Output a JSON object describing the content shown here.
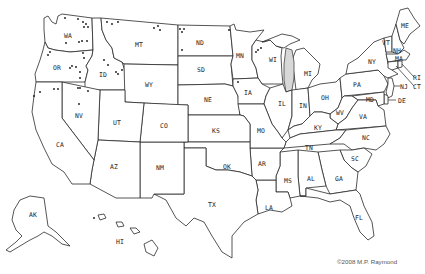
{
  "map": {
    "title": "United States outline map with state abbreviations",
    "line_color": "#2a2a2a",
    "background": "#ffffff",
    "lake_fill": "#d8d8d8",
    "states": [
      {
        "abbr": "WA",
        "x": 68,
        "y": 36
      },
      {
        "abbr": "OR",
        "x": 57,
        "y": 68
      },
      {
        "abbr": "ID",
        "x": 103,
        "y": 75
      },
      {
        "abbr": "MT",
        "x": 139,
        "y": 45
      },
      {
        "abbr": "WY",
        "x": 149,
        "y": 85
      },
      {
        "abbr": "ND",
        "x": 200,
        "y": 43
      },
      {
        "abbr": "SD",
        "x": 201,
        "y": 70
      },
      {
        "abbr": "NE",
        "x": 208,
        "y": 100
      },
      {
        "abbr": "MN",
        "x": 240,
        "y": 56
      },
      {
        "abbr": "WI",
        "x": 273,
        "y": 60
      },
      {
        "abbr": "MI",
        "x": 308,
        "y": 74
      },
      {
        "abbr": "IA",
        "x": 248,
        "y": 93
      },
      {
        "abbr": "IL",
        "x": 282,
        "y": 104
      },
      {
        "abbr": "IN",
        "x": 303,
        "y": 106
      },
      {
        "abbr": "OH",
        "x": 325,
        "y": 98
      },
      {
        "abbr": "PA",
        "x": 357,
        "y": 85
      },
      {
        "abbr": "NY",
        "x": 372,
        "y": 62
      },
      {
        "abbr": "VT",
        "x": 386,
        "y": 43
      },
      {
        "abbr": "NH",
        "x": 397,
        "y": 51
      },
      {
        "abbr": "ME",
        "x": 405,
        "y": 26
      },
      {
        "abbr": "MA",
        "x": 399,
        "y": 59
      },
      {
        "abbr": "RI",
        "x": 417,
        "y": 78
      },
      {
        "abbr": "CT",
        "x": 417,
        "y": 87
      },
      {
        "abbr": "NJ",
        "x": 404,
        "y": 87
      },
      {
        "abbr": "DE",
        "x": 402,
        "y": 101
      },
      {
        "abbr": "MD",
        "x": 370,
        "y": 100
      },
      {
        "abbr": "WV",
        "x": 340,
        "y": 113
      },
      {
        "abbr": "VA",
        "x": 363,
        "y": 117
      },
      {
        "abbr": "KY",
        "x": 318,
        "y": 128
      },
      {
        "abbr": "TN",
        "x": 309,
        "y": 148
      },
      {
        "abbr": "NC",
        "x": 366,
        "y": 138
      },
      {
        "abbr": "SC",
        "x": 355,
        "y": 159
      },
      {
        "abbr": "GA",
        "x": 339,
        "y": 179
      },
      {
        "abbr": "AL",
        "x": 311,
        "y": 179
      },
      {
        "abbr": "MS",
        "x": 288,
        "y": 181
      },
      {
        "abbr": "FL",
        "x": 359,
        "y": 218
      },
      {
        "abbr": "LA",
        "x": 269,
        "y": 208
      },
      {
        "abbr": "AR",
        "x": 262,
        "y": 164
      },
      {
        "abbr": "MO",
        "x": 261,
        "y": 131
      },
      {
        "abbr": "KS",
        "x": 216,
        "y": 131
      },
      {
        "abbr": "OK",
        "x": 227,
        "y": 167
      },
      {
        "abbr": "TX",
        "x": 212,
        "y": 205
      },
      {
        "abbr": "NM",
        "x": 160,
        "y": 168
      },
      {
        "abbr": "CO",
        "x": 164,
        "y": 126
      },
      {
        "abbr": "UT",
        "x": 117,
        "y": 123
      },
      {
        "abbr": "AZ",
        "x": 114,
        "y": 167
      },
      {
        "abbr": "NV",
        "x": 79,
        "y": 116
      },
      {
        "abbr": "CA",
        "x": 60,
        "y": 145
      },
      {
        "abbr": "AK",
        "x": 33,
        "y": 215
      },
      {
        "abbr": "HI",
        "x": 120,
        "y": 242
      }
    ]
  },
  "credit": "©2008 M.P. Raymond"
}
